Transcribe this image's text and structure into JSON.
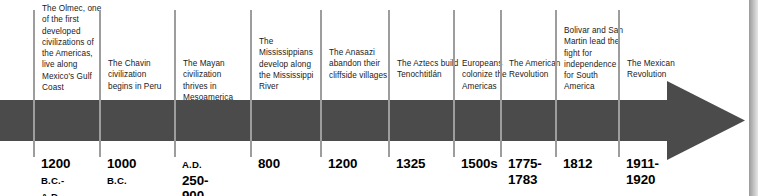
{
  "figure": {
    "type": "horizontal-arrow-timeline",
    "orientation": "left-to-right",
    "bar_color": "#4b4b4b",
    "tick_color": "#9d9d9d",
    "background_color": "#ffffff",
    "text_color": "#1a1a1a"
  },
  "events": [
    {
      "caption": "The Olmec, one of the first developed civilizations of the Americas, live along Mexico's Gulf Coast",
      "date_main": "1200",
      "date_era": "B.C.-",
      "date_second_era": "A.D.",
      "date_second_main": "400",
      "date_full": "1200 B.C.-A.D. 400",
      "x": 33,
      "caption_top": 3
    },
    {
      "caption": "The Chavin civilization begins in Peru",
      "date_main": "1000",
      "date_era": "B.C.",
      "date_second_era": "",
      "date_second_main": "",
      "date_full": "1000 B.C.",
      "x": 99,
      "caption_top": 58
    },
    {
      "caption": "The Mayan civilization thrives in Mesoamerica",
      "date_main": "250-",
      "date_era": "A.D.",
      "date_second_era": "",
      "date_second_main": "900",
      "date_full": "A.D. 250-900",
      "x": 174,
      "caption_top": 58
    },
    {
      "caption": "The Mississippians develop along the Mississippi River",
      "date_main": "800",
      "date_era": "",
      "date_second_era": "",
      "date_second_main": "",
      "date_full": "800",
      "x": 250,
      "caption_top": 36
    },
    {
      "caption": "The Anasazi abandon their cliffside villages",
      "date_main": "1200",
      "date_era": "",
      "date_second_era": "",
      "date_second_main": "",
      "date_full": "1200",
      "x": 320,
      "caption_top": 47
    },
    {
      "caption": "The Aztecs build Tenochtitlán",
      "date_main": "1325",
      "date_era": "",
      "date_second_era": "",
      "date_second_main": "",
      "date_full": "1325",
      "x": 388,
      "caption_top": 58
    },
    {
      "caption": "Europeans colonize the Americas",
      "date_main": "1500s",
      "date_era": "",
      "date_second_era": "",
      "date_second_main": "",
      "date_full": "1500s",
      "x": 453,
      "caption_top": 58
    },
    {
      "caption": "The American Revolution",
      "date_main": "1775-",
      "date_era": "",
      "date_second_era": "",
      "date_second_main": "1783",
      "date_full": "1775-1783",
      "x": 500,
      "caption_top": 58
    },
    {
      "caption": "Bolivar and San Martin lead the fight for independence for South America",
      "date_main": "1812",
      "date_era": "",
      "date_second_era": "",
      "date_second_main": "",
      "date_full": "1812",
      "x": 555,
      "caption_top": 25
    },
    {
      "caption": "The Mexican Revolution",
      "date_main": "1911-",
      "date_era": "",
      "date_second_era": "",
      "date_second_main": "1920",
      "date_full": "1911-1920",
      "x": 618,
      "caption_top": 58
    }
  ]
}
